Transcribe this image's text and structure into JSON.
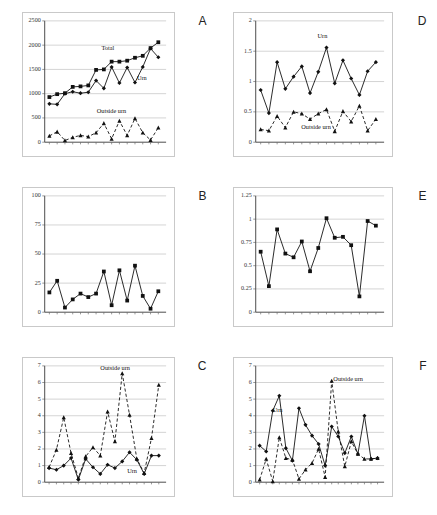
{
  "figure": {
    "panel_letters": [
      "A",
      "B",
      "C",
      "D",
      "E",
      "F"
    ],
    "series_labels": {
      "total": "Total",
      "urn": "Urn",
      "outside": "Outside urn"
    }
  },
  "chart_data": [
    {
      "id": "A",
      "type": "line",
      "title": "A",
      "xlabel": "",
      "ylabel": "",
      "ylim": [
        0,
        2500
      ],
      "yticks": [
        0,
        500,
        1000,
        1500,
        2000,
        2500
      ],
      "grid": true,
      "legend": "annotations",
      "x": [
        1,
        2,
        3,
        4,
        5,
        6,
        7,
        8,
        9,
        10,
        11,
        12,
        13,
        14,
        15,
        16,
        17,
        18,
        19,
        20
      ],
      "series": [
        {
          "name": "Total",
          "marker": "square",
          "style": "solid",
          "values": [
            930,
            990,
            1010,
            1140,
            1150,
            1170,
            1490,
            1500,
            1660,
            1660,
            1680,
            1740,
            1780,
            1940,
            2060,
            null,
            null,
            null,
            null,
            null
          ]
        },
        {
          "name": "Urn",
          "marker": "diamond",
          "style": "solid",
          "values": [
            790,
            780,
            1000,
            1040,
            1010,
            1030,
            1270,
            1110,
            1550,
            1220,
            1540,
            1230,
            1550,
            1930,
            1750,
            null,
            null,
            null,
            null,
            null
          ]
        },
        {
          "name": "Outside urn",
          "marker": "triangle",
          "style": "dashed",
          "values": [
            130,
            215,
            35,
            100,
            140,
            115,
            195,
            390,
            70,
            440,
            140,
            490,
            195,
            45,
            300,
            null,
            null,
            null,
            null,
            null
          ]
        }
      ]
    },
    {
      "id": "B",
      "type": "line",
      "title": "B",
      "xlabel": "",
      "ylabel": "",
      "ylim": [
        0,
        100
      ],
      "yticks": [
        0,
        25,
        50,
        75,
        100
      ],
      "grid": true,
      "legend": "none",
      "x": [
        1,
        2,
        3,
        4,
        5,
        6,
        7,
        8,
        9,
        10,
        11,
        12,
        13,
        14,
        15
      ],
      "series": [
        {
          "name": "Outside urn %",
          "marker": "square",
          "style": "solid",
          "values": [
            17,
            27,
            4,
            11,
            16,
            13,
            16,
            35,
            6,
            36,
            10,
            40,
            14,
            3,
            18
          ]
        }
      ]
    },
    {
      "id": "C",
      "type": "line",
      "title": "C",
      "xlabel": "",
      "ylabel": "",
      "ylim": [
        0,
        7
      ],
      "yticks": [
        0,
        1,
        2,
        3,
        4,
        5,
        6,
        7
      ],
      "grid": true,
      "legend": "annotations",
      "x": [
        1,
        2,
        3,
        4,
        5,
        6,
        7,
        8,
        9,
        10,
        11,
        12,
        13,
        14,
        15,
        16,
        17,
        18
      ],
      "series": [
        {
          "name": "Urn",
          "marker": "diamond",
          "style": "solid",
          "values": [
            0.85,
            0.75,
            1.0,
            1.45,
            0.15,
            1.4,
            0.9,
            0.5,
            1.05,
            0.85,
            1.25,
            1.8,
            1.35,
            0.5,
            1.6,
            1.6,
            null,
            null
          ]
        },
        {
          "name": "Outside urn",
          "marker": "triangle",
          "style": "dashed",
          "values": [
            0.9,
            1.95,
            3.9,
            1.75,
            0.25,
            1.55,
            2.1,
            1.6,
            4.25,
            2.45,
            6.55,
            4.05,
            1.4,
            0.55,
            2.65,
            5.85,
            null,
            null
          ]
        }
      ]
    },
    {
      "id": "D",
      "type": "line",
      "title": "D",
      "xlabel": "",
      "ylabel": "",
      "ylim": [
        0,
        2
      ],
      "yticks": [
        0,
        0.5,
        1,
        1.5,
        2
      ],
      "grid": true,
      "legend": "annotations",
      "x": [
        1,
        2,
        3,
        4,
        5,
        6,
        7,
        8,
        9,
        10,
        11,
        12,
        13,
        14,
        15,
        16,
        17
      ],
      "series": [
        {
          "name": "Urn",
          "marker": "diamond",
          "style": "solid",
          "values": [
            0.86,
            0.48,
            1.32,
            0.88,
            1.08,
            1.25,
            0.81,
            1.16,
            1.56,
            0.97,
            1.35,
            1.05,
            0.78,
            1.17,
            1.32,
            null,
            null
          ]
        },
        {
          "name": "Outside urn",
          "marker": "triangle",
          "style": "dashed",
          "values": [
            0.21,
            0.19,
            0.43,
            0.24,
            0.5,
            0.47,
            0.38,
            0.47,
            0.54,
            0.18,
            0.51,
            0.34,
            0.6,
            0.19,
            0.38,
            null,
            null
          ]
        }
      ]
    },
    {
      "id": "E",
      "type": "line",
      "title": "E",
      "xlabel": "",
      "ylabel": "",
      "ylim": [
        0,
        1.25
      ],
      "yticks": [
        0,
        0.25,
        0.5,
        0.75,
        1,
        1.25
      ],
      "grid": true,
      "legend": "none",
      "x": [
        1,
        2,
        3,
        4,
        5,
        6,
        7,
        8,
        9,
        10,
        11,
        12,
        13,
        14,
        15,
        16
      ],
      "series": [
        {
          "name": "Ratio",
          "marker": "square",
          "style": "solid",
          "values": [
            0.65,
            0.28,
            0.89,
            0.63,
            0.59,
            0.76,
            0.44,
            0.69,
            1.01,
            0.8,
            0.81,
            0.72,
            0.17,
            0.98,
            0.93,
            null
          ]
        }
      ]
    },
    {
      "id": "F",
      "type": "line",
      "title": "F",
      "xlabel": "",
      "ylabel": "",
      "ylim": [
        0,
        7
      ],
      "yticks": [
        0,
        1,
        2,
        3,
        4,
        5,
        6,
        7
      ],
      "grid": true,
      "legend": "annotations",
      "x": [
        1,
        2,
        3,
        4,
        5,
        6,
        7,
        8,
        9,
        10,
        11,
        12,
        13,
        14,
        15,
        16,
        17,
        18,
        19,
        20,
        21
      ],
      "series": [
        {
          "name": "Urn",
          "marker": "diamond",
          "style": "solid",
          "values": [
            2.2,
            1.85,
            4.3,
            5.2,
            2.05,
            1.3,
            4.45,
            3.45,
            2.8,
            2.3,
            1.0,
            3.35,
            2.75,
            1.75,
            2.75,
            1.7,
            4.0,
            1.4,
            1.45,
            null,
            null
          ]
        },
        {
          "name": "Outside urn",
          "marker": "triangle",
          "style": "dashed",
          "values": [
            0.15,
            1.4,
            0.05,
            2.7,
            1.45,
            1.35,
            0.2,
            0.75,
            1.15,
            2.0,
            0.3,
            6.1,
            3.05,
            0.95,
            2.45,
            1.7,
            1.4,
            1.4,
            1.45,
            null,
            null
          ]
        }
      ]
    }
  ],
  "annotations": {
    "A": [
      {
        "text": "Total",
        "x": 0.52,
        "y": 1890
      },
      {
        "text": "Urn",
        "x": 0.8,
        "y": 1290
      },
      {
        "text": "Outside urn",
        "x": 0.55,
        "y": 600
      }
    ],
    "C": [
      {
        "text": "Outside urn",
        "x": 0.58,
        "y": 6.75
      },
      {
        "text": "Urn",
        "x": 0.72,
        "y": 0.55
      }
    ],
    "D": [
      {
        "text": "Urn",
        "x": 0.52,
        "y": 1.72
      },
      {
        "text": "Outside urn",
        "x": 0.47,
        "y": 0.22
      }
    ],
    "F": [
      {
        "text": "Outside urn",
        "x": 0.72,
        "y": 6.1
      },
      {
        "text": "Urn",
        "x": 0.17,
        "y": 4.25
      }
    ]
  }
}
